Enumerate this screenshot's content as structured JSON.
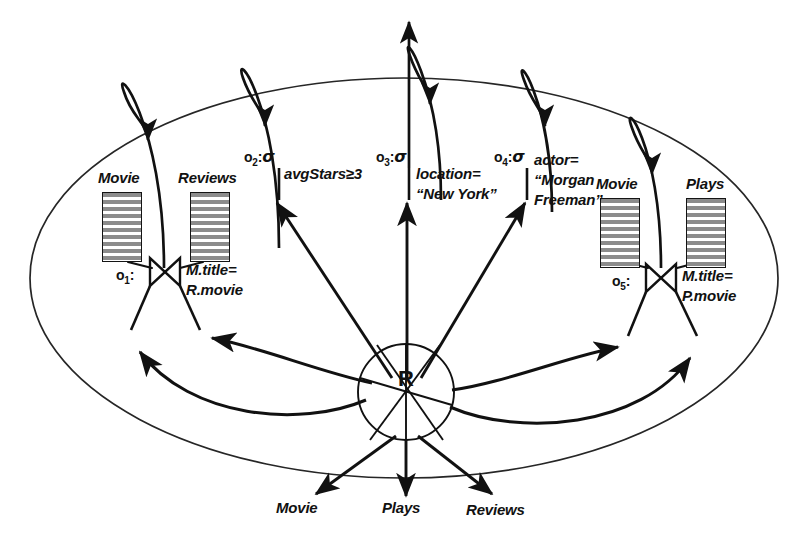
{
  "diagram": {
    "hub": {
      "label": "R",
      "name": "mediator-hub"
    },
    "boundary": {
      "shape": "ellipse",
      "name": "system-boundary"
    },
    "relations": [
      {
        "id": "rel-movie-left",
        "label": "Movie"
      },
      {
        "id": "rel-reviews-left",
        "label": "Reviews"
      },
      {
        "id": "rel-movie-right",
        "label": "Movie"
      },
      {
        "id": "rel-plays-right",
        "label": "Plays"
      }
    ],
    "operators": [
      {
        "id": "o1",
        "idtext": "o",
        "sub": "1",
        "colon": ":",
        "kind": "join",
        "symbol": "⋈",
        "condition_line1": "M.title=",
        "condition_line2": "R.movie"
      },
      {
        "id": "o2",
        "idtext": "o",
        "sub": "2",
        "colon": ":",
        "kind": "select",
        "symbol": "σ",
        "condition_line1": "avgStars≥3",
        "condition_line2": ""
      },
      {
        "id": "o3",
        "idtext": "o",
        "sub": "3",
        "colon": ":",
        "kind": "select",
        "symbol": "σ",
        "condition_line1": "location=",
        "condition_line2": "“New York”"
      },
      {
        "id": "o4",
        "idtext": "o",
        "sub": "4",
        "colon": ":",
        "kind": "select",
        "symbol": "σ",
        "condition_line1": "actor=",
        "condition_line2": "“Morgan",
        "condition_line3": "Freeman”"
      },
      {
        "id": "o5",
        "idtext": "o",
        "sub": "5",
        "colon": ":",
        "kind": "join",
        "symbol": "⋈",
        "condition_line1": "M.title=",
        "condition_line2": "P.movie"
      }
    ],
    "outputs": [
      {
        "id": "out-movie",
        "label": "Movie"
      },
      {
        "id": "out-plays",
        "label": "Plays"
      },
      {
        "id": "out-reviews",
        "label": "Reviews"
      }
    ],
    "colors": {
      "stroke": "#111111",
      "boundary": "#262626",
      "table_stripe": "#8c8c8c",
      "background": "#ffffff"
    }
  }
}
